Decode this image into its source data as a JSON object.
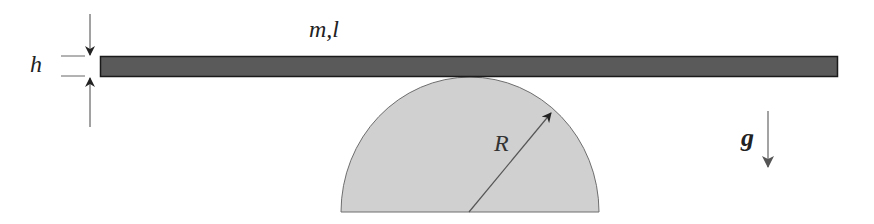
{
  "diagram": {
    "labels": {
      "thickness": "h",
      "mass_length": "m,l",
      "radius": "R",
      "gravity": "g"
    },
    "elements": [
      {
        "id": "bar",
        "type": "rectangle",
        "description": "thin uniform bar of mass m, length l, thickness h"
      },
      {
        "id": "half-cylinder",
        "type": "semicircle",
        "description": "fixed half-cylinder of radius R"
      },
      {
        "id": "radius-arrow",
        "type": "arrow",
        "description": "radius from center to arc"
      },
      {
        "id": "gravity-arrow",
        "type": "arrow",
        "description": "gravity pointing downward"
      },
      {
        "id": "thickness-dimension",
        "type": "dimension",
        "description": "thickness h of bar"
      }
    ],
    "colors": {
      "bar_fill": "#5a5a5a",
      "bar_stroke": "#1a1a1a",
      "cylinder_fill": "#d0d0d0",
      "cylinder_stroke": "#6e6e6e",
      "line": "#555555"
    }
  }
}
